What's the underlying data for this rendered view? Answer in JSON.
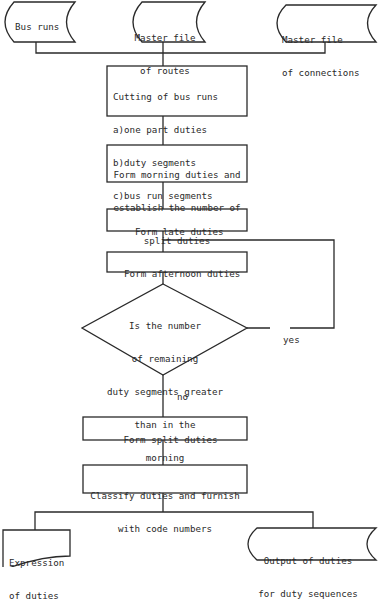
{
  "diagram": {
    "type": "flowchart",
    "inputs": [
      {
        "id": "bus_runs",
        "shape": "stored-data",
        "lines": [
          "Bus runs"
        ]
      },
      {
        "id": "master_routes",
        "shape": "stored-data",
        "lines": [
          "Master file",
          "of routes"
        ]
      },
      {
        "id": "master_connections",
        "shape": "stored-data",
        "lines": [
          "Master file",
          "of connections"
        ]
      }
    ],
    "steps": [
      {
        "id": "cutting",
        "shape": "process",
        "lines": [
          "Cutting of bus runs",
          "a)one part duties",
          "b)duty segments",
          "c)bus run segments"
        ]
      },
      {
        "id": "morning",
        "shape": "process",
        "lines": [
          "Form morning duties and",
          "establish the number of",
          "split duties"
        ]
      },
      {
        "id": "late",
        "shape": "process",
        "lines": [
          "Form late duties"
        ]
      },
      {
        "id": "afternoon",
        "shape": "process",
        "lines": [
          "Form afternoon duties"
        ]
      },
      {
        "id": "decision",
        "shape": "decision",
        "lines": [
          "Is the number",
          "of remaining",
          "duty segments greater",
          "than in the",
          "morning"
        ]
      },
      {
        "id": "split",
        "shape": "process",
        "lines": [
          "Form split duties"
        ]
      },
      {
        "id": "classify",
        "shape": "process",
        "lines": [
          "Classify duties and furnish",
          "with code numbers"
        ]
      }
    ],
    "branch_labels": {
      "yes": "yes",
      "no": "no"
    },
    "outputs": [
      {
        "id": "expression",
        "shape": "document",
        "lines": [
          "Expression",
          "of duties"
        ]
      },
      {
        "id": "output_sequences",
        "shape": "stored-data",
        "lines": [
          "Output of duties",
          "for duty sequences"
        ]
      }
    ],
    "edges": [
      [
        "bus_runs",
        "cutting"
      ],
      [
        "master_routes",
        "cutting"
      ],
      [
        "master_connections",
        "cutting"
      ],
      [
        "cutting",
        "morning"
      ],
      [
        "morning",
        "late"
      ],
      [
        "late",
        "afternoon"
      ],
      [
        "afternoon",
        "decision"
      ],
      [
        "decision",
        "afternoon",
        "yes"
      ],
      [
        "decision",
        "split",
        "no"
      ],
      [
        "split",
        "classify"
      ],
      [
        "classify",
        "expression"
      ],
      [
        "classify",
        "output_sequences"
      ]
    ]
  }
}
